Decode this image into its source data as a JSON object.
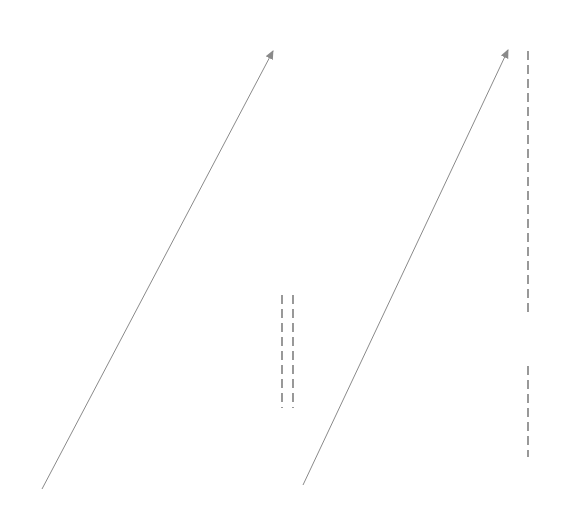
{
  "diagram": {
    "columns": [
      {
        "id": "left",
        "right_edge": 54,
        "items": [
          {
            "label": "0",
            "row": 0
          },
          {
            "label": "1",
            "row": 1
          },
          {
            "label": "2",
            "row": 2
          },
          {
            "label": "3",
            "row": 3
          },
          {
            "label": "4",
            "row": 4
          },
          {
            "label": "5",
            "row": 5
          },
          {
            "label": "6",
            "row": 6
          },
          {
            "label": "7",
            "row": 7
          },
          {
            "label": "8",
            "row": 8
          },
          {
            "label": "9",
            "row": 9
          },
          {
            "label": "10",
            "row": 10
          },
          {
            "label": "11",
            "row": 11
          },
          {
            "label": "12",
            "row": 12
          },
          {
            "label": "13",
            "row": 13
          },
          {
            "label": "14",
            "row": 14
          },
          {
            "label": "15",
            "row": 15
          },
          {
            "label": "16",
            "row": 16
          },
          {
            "label": "17",
            "row": 17
          },
          {
            "label": "18",
            "row": 18
          },
          {
            "label": "19",
            "row": 19
          }
        ]
      },
      {
        "id": "middle",
        "right_edge": 299,
        "items": [
          {
            "label": "20",
            "row": 0
          },
          {
            "label": "21",
            "row": 1
          },
          {
            "label": "22",
            "row": 2
          },
          {
            "label": "23",
            "row": 3
          },
          {
            "label": "24",
            "row": 4
          },
          {
            "label": "25",
            "row": 5
          },
          {
            "label": "26",
            "row": 6
          },
          {
            "label": "27",
            "row": 7
          },
          {
            "label": "28",
            "row": 8
          },
          {
            "label": "29",
            "row": 9
          },
          {
            "label": "30",
            "row": 10
          },
          {
            "label": "99",
            "row": 16
          },
          {
            "label": "100",
            "row": 17
          },
          {
            "label": "101",
            "row": 18
          },
          {
            "label": "102",
            "row": 19
          }
        ]
      },
      {
        "id": "right",
        "right_edge": 545,
        "items": [
          {
            "label": "103",
            "row": 0
          },
          {
            "label": "199",
            "row": 12
          },
          {
            "label": "200",
            "row": 13
          },
          {
            "label": "999",
            "row": 18
          },
          {
            "label": "1000",
            "row": 19
          }
        ]
      }
    ],
    "arrows": [
      {
        "from": "19",
        "to": "20",
        "x1": 42,
        "y1": 489,
        "x2": 273,
        "y2": 51
      },
      {
        "from": "102",
        "to": "103",
        "x1": 303,
        "y1": 485,
        "x2": 508,
        "y2": 50
      }
    ],
    "dashed_lines": [
      {
        "x": 282,
        "y1": 295,
        "y2": 408
      },
      {
        "x": 293,
        "y1": 295,
        "y2": 408
      },
      {
        "x": 528,
        "y1": 51,
        "y2": 312
      },
      {
        "x": 528,
        "y1": 366,
        "y2": 457
      }
    ],
    "colors": {
      "text": "#2a2a2a",
      "arrow": "#8a8a8a",
      "dash": "#555555"
    },
    "layout": {
      "row_top": 32,
      "row_height": 23.75
    }
  }
}
